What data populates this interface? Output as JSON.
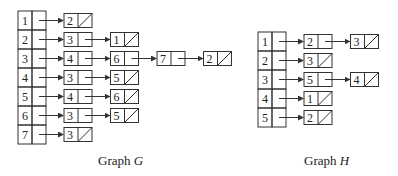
{
  "graphs": [
    {
      "id": "G",
      "caption_prefix": "Graph ",
      "caption_var": "G",
      "array_x": 18,
      "array_top": 11,
      "row_h": 19,
      "lists": [
        {
          "vertex": "1",
          "adj": [
            "2"
          ]
        },
        {
          "vertex": "2",
          "adj": [
            "3",
            "1"
          ]
        },
        {
          "vertex": "3",
          "adj": [
            "4",
            "6",
            "7",
            "2"
          ]
        },
        {
          "vertex": "4",
          "adj": [
            "3",
            "5"
          ]
        },
        {
          "vertex": "5",
          "adj": [
            "4",
            "6"
          ]
        },
        {
          "vertex": "6",
          "adj": [
            "3",
            "5"
          ]
        },
        {
          "vertex": "7",
          "adj": [
            "3"
          ]
        }
      ],
      "caption_x": 98,
      "caption_y": 153
    },
    {
      "id": "H",
      "caption_prefix": "Graph ",
      "caption_var": "H",
      "array_x": 258,
      "array_top": 32,
      "row_h": 19,
      "lists": [
        {
          "vertex": "1",
          "adj": [
            "2",
            "3"
          ]
        },
        {
          "vertex": "2",
          "adj": [
            "3"
          ]
        },
        {
          "vertex": "3",
          "adj": [
            "5",
            "4"
          ]
        },
        {
          "vertex": "4",
          "adj": [
            "1"
          ]
        },
        {
          "vertex": "5",
          "adj": [
            "2"
          ]
        }
      ],
      "caption_x": 304,
      "caption_y": 153
    }
  ],
  "colors": {
    "stroke": "#333333",
    "text": "#222222",
    "background": "#ffffff"
  }
}
